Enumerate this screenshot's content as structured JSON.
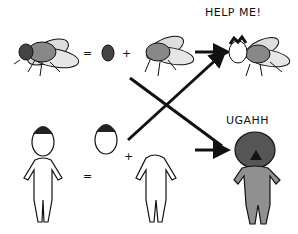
{
  "illustration": {
    "caption_top": "HELP ME!",
    "caption_bottom": "UGAHH",
    "operators": {
      "equals": "=",
      "plus": "+"
    },
    "colors": {
      "ink": "#111111",
      "fly_body": "#8a8a8a",
      "wing": "#dcdcdc",
      "eye": "#444444",
      "monster": "#909090",
      "hair": "#222222"
    }
  }
}
